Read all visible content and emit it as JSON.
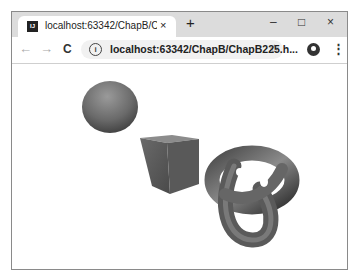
{
  "browser": {
    "tab": {
      "favicon": "IJ",
      "title": "localhost:63342/ChapB/ChapB225.html",
      "close_icon": "×"
    },
    "new_tab_icon": "+",
    "window_controls": {
      "minimize": "–",
      "maximize": "□",
      "close": "×"
    },
    "toolbar": {
      "back_icon": "←",
      "forward_icon": "→",
      "reload_icon": "C",
      "info_icon": "i",
      "url": "localhost:63342/ChapB/ChapB225.h...",
      "bookmark_icon": "☆",
      "menu_icon": "⋮"
    }
  },
  "scene": {
    "objects": [
      {
        "name": "sphere",
        "shape": "sphere"
      },
      {
        "name": "cube",
        "shape": "box"
      },
      {
        "name": "torus-knot",
        "shape": "torus-knot"
      }
    ],
    "colors": {
      "background": "#ffffff",
      "material": "#7a7a7a"
    }
  }
}
